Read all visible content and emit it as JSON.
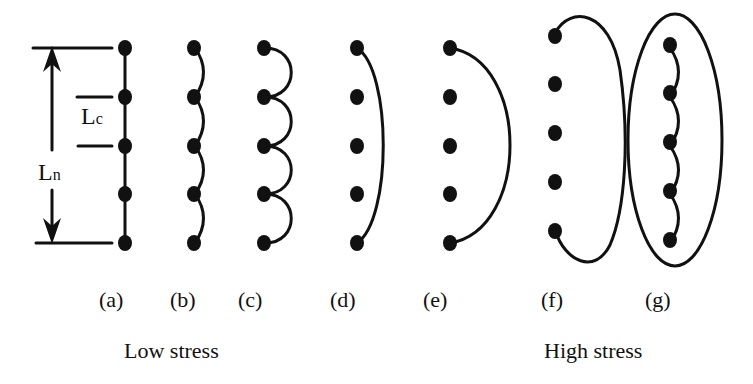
{
  "figure": {
    "panels": [
      {
        "id": "a",
        "label": "(a)",
        "description": "straight chain with crosslinks, segment length Lc, network length Ln"
      },
      {
        "id": "b",
        "label": "(b)",
        "description": "slightly coiled chain between neighboring crosslinks"
      },
      {
        "id": "c",
        "label": "(c)",
        "description": "strongly coiled chain between neighboring crosslinks"
      },
      {
        "id": "d",
        "label": "(d)",
        "description": "chain spanning first to last crosslink, slight arc"
      },
      {
        "id": "e",
        "label": "(e)",
        "description": "chain spanning first to last crosslink, large arc"
      },
      {
        "id": "f",
        "label": "(f)",
        "description": "large loop beyond end crosslinks"
      },
      {
        "id": "g",
        "label": "(g)",
        "description": "coiled chain enclosed by ellipse"
      }
    ],
    "annotations": {
      "lc_main": "L",
      "lc_sub": "c",
      "ln_main": "L",
      "ln_sub": "n"
    },
    "groups": {
      "low": "Low stress",
      "high": "High stress"
    }
  },
  "colors": {
    "ink": "#111111",
    "background": "#ffffff"
  }
}
